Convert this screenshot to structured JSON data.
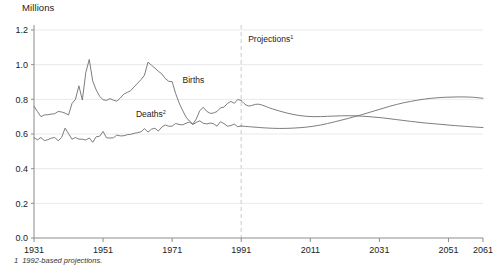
{
  "figure": {
    "unit_label": "Millions",
    "footnote_number": "1",
    "footnote_text": "1992-based projections.",
    "projection_label": "Projections",
    "projection_sup": "1",
    "births_label": "Births",
    "deaths_label": "Deaths",
    "deaths_sup": "2",
    "axis_color": "#8c8c8c",
    "grid_color": "#e3e3e3",
    "line_color": "#6e6e6e",
    "projection_rule_color": "#d9d9d9"
  },
  "chart_data": {
    "type": "line",
    "title": "",
    "subtitle": "",
    "xlabel": "",
    "ylabel": "Millions",
    "xlim": [
      1931,
      2061
    ],
    "ylim": [
      0.0,
      1.2
    ],
    "yticks": [
      "0.0",
      "0.2",
      "0.4",
      "0.6",
      "0.8",
      "1.0",
      "1.2"
    ],
    "ytick_values": [
      0.0,
      0.2,
      0.4,
      0.6,
      0.8,
      1.0,
      1.2
    ],
    "xticks": [
      "1931",
      "1951",
      "1971",
      "1991",
      "2011",
      "2031",
      "2051",
      "2061"
    ],
    "xtick_values": [
      1931,
      1951,
      1971,
      1991,
      2011,
      2031,
      2051,
      2061
    ],
    "grid": "horizontal",
    "legend": "inline-annotations",
    "projection_start_year": 1991,
    "annotations": [
      {
        "text": "Births",
        "x": 1974,
        "y": 0.9
      },
      {
        "text": "Deaths",
        "x": 1962,
        "y": 0.7
      },
      {
        "text": "Projections",
        "x": 1993,
        "y": 1.13
      }
    ],
    "series": [
      {
        "name": "Births",
        "x": [
          1931,
          1932,
          1933,
          1934,
          1935,
          1936,
          1937,
          1938,
          1939,
          1940,
          1941,
          1942,
          1943,
          1944,
          1945,
          1946,
          1947,
          1948,
          1949,
          1950,
          1951,
          1952,
          1953,
          1954,
          1955,
          1956,
          1957,
          1958,
          1959,
          1960,
          1961,
          1962,
          1963,
          1964,
          1965,
          1966,
          1967,
          1968,
          1969,
          1970,
          1971,
          1972,
          1973,
          1974,
          1975,
          1976,
          1977,
          1978,
          1979,
          1980,
          1981,
          1982,
          1983,
          1984,
          1985,
          1986,
          1987,
          1988,
          1989,
          1990,
          1991,
          1993,
          1996,
          2000,
          2004,
          2008,
          2012,
          2016,
          2020,
          2024,
          2028,
          2032,
          2036,
          2040,
          2044,
          2048,
          2052,
          2056,
          2061
        ],
        "y": [
          0.76,
          0.73,
          0.7,
          0.71,
          0.711,
          0.715,
          0.717,
          0.73,
          0.727,
          0.72,
          0.71,
          0.776,
          0.8,
          0.878,
          0.796,
          0.955,
          1.03,
          0.905,
          0.855,
          0.818,
          0.797,
          0.794,
          0.804,
          0.795,
          0.789,
          0.808,
          0.83,
          0.84,
          0.85,
          0.872,
          0.893,
          0.914,
          0.94,
          1.015,
          0.997,
          0.98,
          0.962,
          0.947,
          0.92,
          0.904,
          0.902,
          0.834,
          0.78,
          0.737,
          0.698,
          0.675,
          0.657,
          0.687,
          0.735,
          0.754,
          0.731,
          0.719,
          0.721,
          0.73,
          0.751,
          0.755,
          0.776,
          0.788,
          0.777,
          0.799,
          0.793,
          0.762,
          0.772,
          0.745,
          0.722,
          0.706,
          0.7,
          0.702,
          0.705,
          0.705,
          0.7,
          0.693,
          0.683,
          0.673,
          0.664,
          0.657,
          0.65,
          0.644,
          0.637
        ]
      },
      {
        "name": "Deaths",
        "x": [
          1931,
          1932,
          1933,
          1934,
          1935,
          1936,
          1937,
          1938,
          1939,
          1940,
          1941,
          1942,
          1943,
          1944,
          1945,
          1946,
          1947,
          1948,
          1949,
          1950,
          1951,
          1952,
          1953,
          1954,
          1955,
          1956,
          1957,
          1958,
          1959,
          1960,
          1961,
          1962,
          1963,
          1964,
          1965,
          1966,
          1967,
          1968,
          1969,
          1970,
          1971,
          1972,
          1973,
          1974,
          1975,
          1976,
          1977,
          1978,
          1979,
          1980,
          1981,
          1982,
          1983,
          1984,
          1985,
          1986,
          1987,
          1988,
          1989,
          1990,
          1991,
          1994,
          1998,
          2002,
          2006,
          2010,
          2014,
          2018,
          2022,
          2026,
          2030,
          2034,
          2038,
          2042,
          2046,
          2050,
          2054,
          2058,
          2061
        ],
        "y": [
          0.579,
          0.566,
          0.58,
          0.562,
          0.567,
          0.576,
          0.58,
          0.561,
          0.58,
          0.634,
          0.602,
          0.57,
          0.58,
          0.57,
          0.57,
          0.565,
          0.577,
          0.552,
          0.584,
          0.587,
          0.615,
          0.578,
          0.577,
          0.578,
          0.594,
          0.589,
          0.59,
          0.596,
          0.598,
          0.604,
          0.608,
          0.613,
          0.631,
          0.611,
          0.628,
          0.633,
          0.617,
          0.64,
          0.652,
          0.645,
          0.645,
          0.661,
          0.655,
          0.653,
          0.662,
          0.669,
          0.655,
          0.667,
          0.676,
          0.662,
          0.658,
          0.663,
          0.659,
          0.645,
          0.671,
          0.66,
          0.645,
          0.649,
          0.657,
          0.642,
          0.646,
          0.641,
          0.635,
          0.632,
          0.634,
          0.64,
          0.652,
          0.67,
          0.69,
          0.712,
          0.736,
          0.76,
          0.78,
          0.795,
          0.806,
          0.812,
          0.814,
          0.812,
          0.806
        ]
      }
    ]
  }
}
